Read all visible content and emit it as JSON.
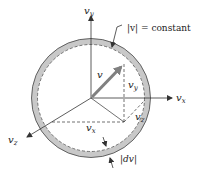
{
  "labels": {
    "vy_axis": "v",
    "vy_axis_sub": "y",
    "vx_axis": "v",
    "vx_axis_sub": "x",
    "vz_axis": "v",
    "vz_axis_sub": "z",
    "v_vector": "v",
    "vy_component": "v",
    "vy_component_sub": "y",
    "vz_component": "v",
    "vz_component_sub": "z",
    "vx_component": "v",
    "vx_component_sub": "x",
    "constant": "|v| = constant",
    "dv": "|dv|"
  },
  "colors": {
    "shell": "#c8c8c8",
    "lines": "#333333",
    "vector": "#808080"
  }
}
